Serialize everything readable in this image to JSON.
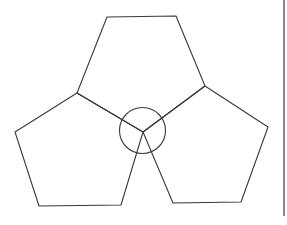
{
  "figure": {
    "stroke_color": "#3a3a3a",
    "background": "#ffffff",
    "shapes": {
      "top_pentagon": [
        [
          107,
          17
        ],
        [
          176,
          16
        ],
        [
          205,
          86
        ],
        [
          143,
          132
        ],
        [
          77,
          93
        ]
      ],
      "left_pentagon": [
        [
          77,
          93
        ],
        [
          143,
          132
        ],
        [
          121,
          205
        ],
        [
          39,
          206
        ],
        [
          15,
          132
        ]
      ],
      "right_pentagon": [
        [
          205,
          86
        ],
        [
          268,
          127
        ],
        [
          241,
          202
        ],
        [
          173,
          203
        ],
        [
          143,
          132
        ]
      ],
      "center_circle": {
        "cx": 142.5,
        "cy": 130.5,
        "r": 23
      }
    },
    "right_border_line": {
      "x": 284,
      "y1": 0,
      "y2": 216
    }
  }
}
